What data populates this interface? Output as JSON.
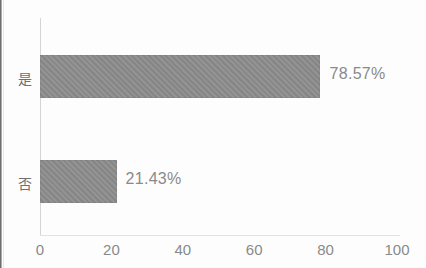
{
  "chart_data": {
    "type": "bar",
    "orientation": "horizontal",
    "title": "",
    "subtitle": "",
    "xlabel": "",
    "ylabel": "",
    "categories": [
      "是",
      "否"
    ],
    "values": [
      78.57,
      21.43
    ],
    "data_labels": [
      "78.57%",
      "21.43%"
    ],
    "xlim": [
      0,
      100
    ],
    "xticks": [
      0,
      20,
      40,
      60,
      80,
      100
    ],
    "xtick_labels": [
      "0",
      "20",
      "40",
      "60",
      "80",
      "100"
    ],
    "grid": false,
    "legend": null,
    "series": [
      {
        "name": "",
        "values": [
          78.57,
          21.43
        ],
        "color": "#8d8d8d"
      }
    ],
    "colors": {
      "bar_fill": "#8d8d8d",
      "axis_line": "#d4d4d4",
      "text": "#8a8a8a",
      "background": "#fdfdfd"
    }
  }
}
